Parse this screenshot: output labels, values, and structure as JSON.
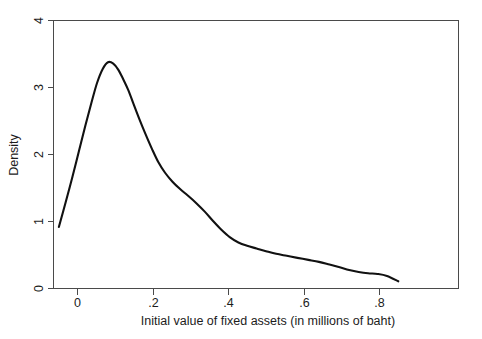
{
  "chart_data": {
    "type": "line",
    "title": "",
    "subtitle": "",
    "xlabel": "Initial value of fixed assets (in millions of baht)",
    "ylabel": "Density",
    "xlim": [
      -0.075,
      1.0
    ],
    "ylim": [
      0,
      4
    ],
    "grid": false,
    "legend": null,
    "x_ticks": [
      "0",
      ".2",
      ".4",
      ".6",
      ".8"
    ],
    "x_tick_values": [
      0,
      0.2,
      0.4,
      0.6,
      0.8
    ],
    "y_ticks": [
      "0",
      "1",
      "2",
      "3",
      "4"
    ],
    "y_tick_values": [
      0,
      1,
      2,
      3,
      4
    ],
    "series": [
      {
        "name": "Density",
        "x": [
          -0.048,
          -0.03,
          -0.012,
          0.005,
          0.022,
          0.038,
          0.053,
          0.068,
          0.082,
          0.096,
          0.109,
          0.122,
          0.136,
          0.15,
          0.165,
          0.181,
          0.198,
          0.215,
          0.233,
          0.252,
          0.272,
          0.293,
          0.315,
          0.338,
          0.36,
          0.382,
          0.404,
          0.427,
          0.45,
          0.475,
          0.5,
          0.527,
          0.555,
          0.583,
          0.612,
          0.64,
          0.668,
          0.695,
          0.72,
          0.745,
          0.77,
          0.795,
          0.82,
          0.85
        ],
        "y": [
          0.91,
          1.28,
          1.66,
          2.04,
          2.42,
          2.76,
          3.06,
          3.27,
          3.37,
          3.35,
          3.26,
          3.12,
          2.95,
          2.74,
          2.52,
          2.3,
          2.08,
          1.88,
          1.72,
          1.59,
          1.48,
          1.38,
          1.27,
          1.14,
          1.0,
          0.87,
          0.76,
          0.68,
          0.63,
          0.59,
          0.55,
          0.51,
          0.48,
          0.45,
          0.42,
          0.39,
          0.35,
          0.31,
          0.27,
          0.24,
          0.22,
          0.21,
          0.18,
          0.1
        ]
      }
    ],
    "peak": {
      "x": 0.082,
      "y": 3.37
    }
  },
  "colors": {
    "curve": "#111111",
    "axis": "#4a4a4a",
    "text": "#1c1c1c",
    "background": "#ffffff"
  }
}
